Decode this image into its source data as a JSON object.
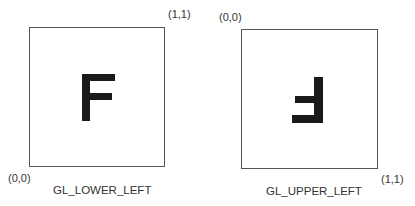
{
  "panels": [
    {
      "caption": "GL_LOWER_LEFT",
      "origin_label": "(0,0)",
      "corner_label": "(1,1)",
      "glyph": "F",
      "orientation": "normal"
    },
    {
      "caption": "GL_UPPER_LEFT",
      "origin_label": "(0,0)",
      "corner_label": "(1,1)",
      "glyph": "F",
      "orientation": "flipped-vertical"
    }
  ]
}
